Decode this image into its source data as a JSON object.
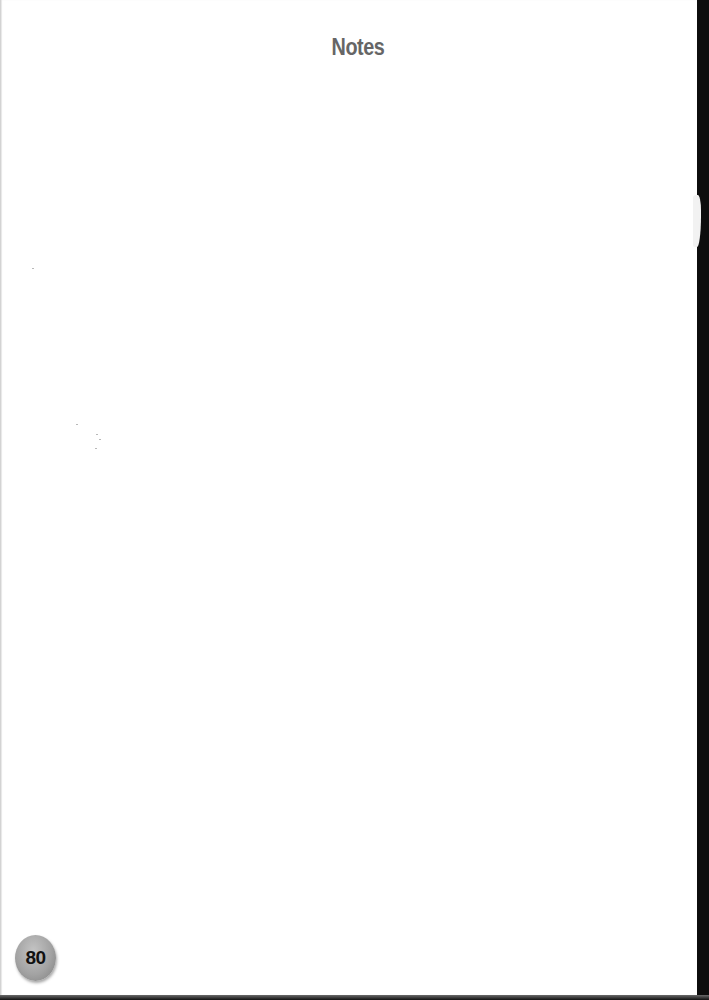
{
  "page": {
    "title": "Notes",
    "page_number": "80"
  },
  "colors": {
    "title": "#666666",
    "badge": "#a3a3a3",
    "page_number": "#111111",
    "background": "#ffffff",
    "edge": "#0d0d0d"
  }
}
